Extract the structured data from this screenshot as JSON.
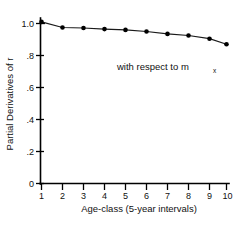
{
  "chart_data": {
    "type": "line",
    "title": "",
    "xlabel": "Age-class (5-year intervals)",
    "ylabel": "Partial Derivatives of r",
    "annotation": "with respect to m",
    "annotation_subscript": "x",
    "x": [
      1,
      2,
      3,
      4,
      5,
      6,
      7,
      8,
      9,
      10
    ],
    "values": [
      1.01,
      0.975,
      0.972,
      0.965,
      0.96,
      0.95,
      0.935,
      0.925,
      0.905,
      0.87
    ],
    "series": [
      {
        "name": "partial derivative of r with respect to m_x",
        "values": [
          1.01,
          0.975,
          0.972,
          0.965,
          0.96,
          0.95,
          0.935,
          0.925,
          0.905,
          0.87
        ]
      }
    ],
    "xlim": [
      1,
      10
    ],
    "ylim": [
      0,
      1.0
    ],
    "xticks": [
      1,
      2,
      3,
      4,
      5,
      6,
      7,
      8,
      9,
      10
    ],
    "xticklabels": [
      "1",
      "2",
      "3",
      "4",
      "5",
      "6",
      "7",
      "8",
      "9",
      "10"
    ],
    "yticks": [
      0,
      0.2,
      0.4,
      0.6,
      0.8,
      1.0
    ],
    "yticklabels": [
      "0",
      ".2",
      ".4",
      ".6",
      ".8",
      "1.0"
    ],
    "grid": false,
    "legend": false,
    "marker": "filled-circle",
    "line_color": "#1a1a1a",
    "marker_color": "#000000",
    "background_color": "#ffffff"
  },
  "axes": {
    "y_title": "Partial Derivatives of r",
    "x_title": "Age-class (5-year intervals)"
  },
  "annotation": {
    "main": "with respect to m",
    "sub": "x"
  },
  "yticklabels": {
    "t0": "0",
    "t1": ".2",
    "t2": ".4",
    "t3": ".6",
    "t4": ".8",
    "t5": "1.0"
  },
  "xticklabels": {
    "t1": "1",
    "t2": "2",
    "t3": "3",
    "t4": "4",
    "t5": "5",
    "t6": "6",
    "t7": "7",
    "t8": "8",
    "t9": "9",
    "t10": "10"
  }
}
